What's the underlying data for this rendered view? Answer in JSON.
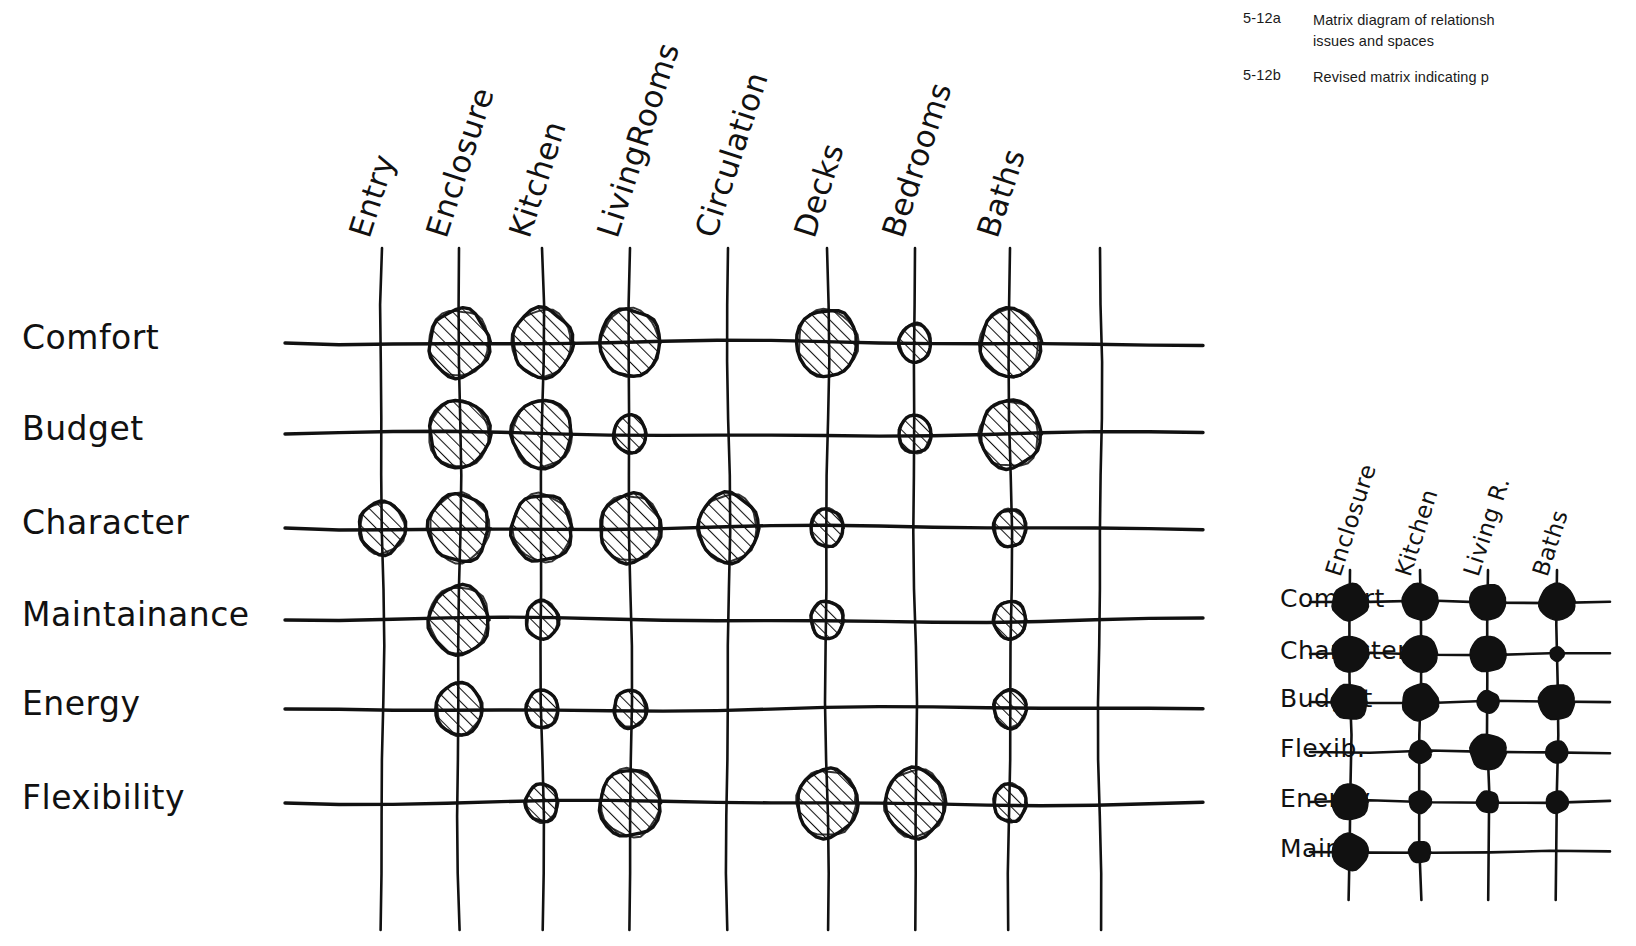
{
  "caption": {
    "entries": [
      {
        "number": "5-12a",
        "text": "Matrix diagram of relationsh",
        "text_line2": "issues and spaces"
      },
      {
        "number": "5-12b",
        "text": "Revised matrix indicating p",
        "text_line2": ""
      }
    ]
  },
  "matrix_a": {
    "columns": [
      "Entry",
      "Enclosure",
      "Kitchen",
      "LivingRooms",
      "Circulation",
      "Decks",
      "Bedrooms",
      "Baths"
    ],
    "rows": [
      "Comfort",
      "Budget",
      "Character",
      "Maintainance",
      "Energy",
      "Flexibility"
    ],
    "marks": [
      {
        "row": "Comfort",
        "col": "Enclosure",
        "size": "large"
      },
      {
        "row": "Comfort",
        "col": "Kitchen",
        "size": "large"
      },
      {
        "row": "Comfort",
        "col": "LivingRooms",
        "size": "large"
      },
      {
        "row": "Comfort",
        "col": "Decks",
        "size": "large"
      },
      {
        "row": "Comfort",
        "col": "Bedrooms",
        "size": "small"
      },
      {
        "row": "Comfort",
        "col": "Baths",
        "size": "large"
      },
      {
        "row": "Budget",
        "col": "Enclosure",
        "size": "large"
      },
      {
        "row": "Budget",
        "col": "Kitchen",
        "size": "large"
      },
      {
        "row": "Budget",
        "col": "LivingRooms",
        "size": "small"
      },
      {
        "row": "Budget",
        "col": "Bedrooms",
        "size": "small"
      },
      {
        "row": "Budget",
        "col": "Baths",
        "size": "large"
      },
      {
        "row": "Character",
        "col": "Entry",
        "size": "medium"
      },
      {
        "row": "Character",
        "col": "Enclosure",
        "size": "large"
      },
      {
        "row": "Character",
        "col": "Kitchen",
        "size": "large"
      },
      {
        "row": "Character",
        "col": "LivingRooms",
        "size": "large"
      },
      {
        "row": "Character",
        "col": "Circulation",
        "size": "large"
      },
      {
        "row": "Character",
        "col": "Decks",
        "size": "small"
      },
      {
        "row": "Character",
        "col": "Baths",
        "size": "small"
      },
      {
        "row": "Maintainance",
        "col": "Enclosure",
        "size": "large"
      },
      {
        "row": "Maintainance",
        "col": "Kitchen",
        "size": "small"
      },
      {
        "row": "Maintainance",
        "col": "Decks",
        "size": "small"
      },
      {
        "row": "Maintainance",
        "col": "Baths",
        "size": "small"
      },
      {
        "row": "Energy",
        "col": "Enclosure",
        "size": "medium"
      },
      {
        "row": "Energy",
        "col": "Kitchen",
        "size": "small"
      },
      {
        "row": "Energy",
        "col": "LivingRooms",
        "size": "small"
      },
      {
        "row": "Energy",
        "col": "Baths",
        "size": "small"
      },
      {
        "row": "Flexibility",
        "col": "Kitchen",
        "size": "small"
      },
      {
        "row": "Flexibility",
        "col": "LivingRooms",
        "size": "large"
      },
      {
        "row": "Flexibility",
        "col": "Decks",
        "size": "large"
      },
      {
        "row": "Flexibility",
        "col": "Bedrooms",
        "size": "large"
      },
      {
        "row": "Flexibility",
        "col": "Baths",
        "size": "small"
      }
    ]
  },
  "matrix_b": {
    "columns": [
      "Enclosure",
      "Kitchen",
      "Living R.",
      "Baths"
    ],
    "rows": [
      "Comfort",
      "Character",
      "Budget",
      "Flexib.",
      "Energy",
      "Maint."
    ],
    "marks": [
      {
        "row": "Comfort",
        "col": "Enclosure",
        "size": "large"
      },
      {
        "row": "Comfort",
        "col": "Kitchen",
        "size": "large"
      },
      {
        "row": "Comfort",
        "col": "Living R.",
        "size": "large"
      },
      {
        "row": "Comfort",
        "col": "Baths",
        "size": "large"
      },
      {
        "row": "Character",
        "col": "Enclosure",
        "size": "large"
      },
      {
        "row": "Character",
        "col": "Kitchen",
        "size": "large"
      },
      {
        "row": "Character",
        "col": "Living R.",
        "size": "large"
      },
      {
        "row": "Character",
        "col": "Baths",
        "size": "small"
      },
      {
        "row": "Budget",
        "col": "Enclosure",
        "size": "large"
      },
      {
        "row": "Budget",
        "col": "Kitchen",
        "size": "large"
      },
      {
        "row": "Budget",
        "col": "Living R.",
        "size": "medium"
      },
      {
        "row": "Budget",
        "col": "Baths",
        "size": "large"
      },
      {
        "row": "Flexib.",
        "col": "Kitchen",
        "size": "medium"
      },
      {
        "row": "Flexib.",
        "col": "Living R.",
        "size": "large"
      },
      {
        "row": "Flexib.",
        "col": "Baths",
        "size": "medium"
      },
      {
        "row": "Energy",
        "col": "Enclosure",
        "size": "large"
      },
      {
        "row": "Energy",
        "col": "Kitchen",
        "size": "medium"
      },
      {
        "row": "Energy",
        "col": "Living R.",
        "size": "medium"
      },
      {
        "row": "Energy",
        "col": "Baths",
        "size": "medium"
      },
      {
        "row": "Maint.",
        "col": "Enclosure",
        "size": "large"
      },
      {
        "row": "Maint.",
        "col": "Kitchen",
        "size": "medium"
      }
    ]
  },
  "colors": {
    "ink": "#111111",
    "caption_text": "#1a1a1a",
    "background": "#ffffff"
  }
}
